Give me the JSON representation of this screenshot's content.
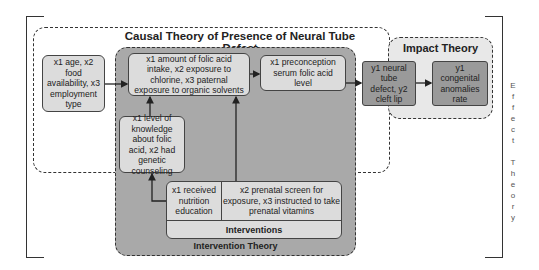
{
  "diagram": {
    "effect_theory_label": "Effect Theory",
    "effect_theory_letters": "E\nf\nf\ne\nc\nt\n \nT\nh\ne\no\nr\ny",
    "causal_theory": {
      "title": "Causal Theory of Presence of Neural Tube Defect"
    },
    "intervention_theory": {
      "title": "Intervention Theory"
    },
    "impact_theory": {
      "title": "Impact Theory"
    },
    "nodes": {
      "age": {
        "text": "x1 age, x2 food availability, x3 employment type"
      },
      "folic": {
        "text": "x1 amount of folic acid intake, x2 exposure to chlorine, x3 paternal exposure to organic solvents"
      },
      "knowledge": {
        "text": "x1 level of knowledge about folic acid, x2 had genetic counseling"
      },
      "serum": {
        "text": "x1 preconception serum folic acid level"
      },
      "ntd": {
        "text": "y1 neural tube defect, y2 cleft lip"
      },
      "congenital": {
        "text": "y1 congenital anomalies rate"
      }
    },
    "interventions": {
      "cell_1": "x1 received nutrition education",
      "cell_2": "x2 prenatal screen for exposure, x3 instructed to take prenatal vitamins",
      "label": "Interventions"
    },
    "edges": [
      {
        "from": "age",
        "to": "folic"
      },
      {
        "from": "folic",
        "to": "serum"
      },
      {
        "from": "serum",
        "to": "ntd"
      },
      {
        "from": "ntd",
        "to": "congenital"
      },
      {
        "from": "knowledge",
        "to": "folic"
      },
      {
        "from": "interventions.cell_1",
        "to": "knowledge"
      },
      {
        "from": "interventions.cell_2",
        "to": "folic"
      }
    ]
  }
}
